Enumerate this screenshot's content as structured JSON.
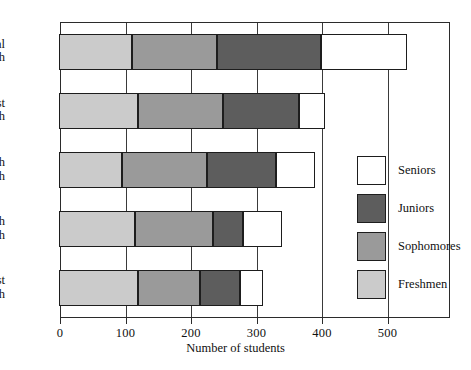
{
  "chart_data": {
    "type": "bar",
    "orientation": "horizontal",
    "stacked": true,
    "title": "",
    "xlabel": "Number of students",
    "ylabel": "",
    "xlim": [
      0,
      560
    ],
    "xticks": [
      0,
      100,
      200,
      300,
      400,
      500
    ],
    "xtick_labels": [
      "0",
      "100",
      "200",
      "300",
      "400",
      "500"
    ],
    "grid": true,
    "legend_position": "right-inside",
    "categories": [
      "Central High",
      "East High",
      "South High",
      "North High",
      "West High"
    ],
    "category_lines": [
      [
        "Central",
        "High"
      ],
      [
        "East",
        "High"
      ],
      [
        "South",
        "High"
      ],
      [
        "North",
        "High"
      ],
      [
        "West",
        "High"
      ]
    ],
    "series": [
      {
        "name": "Freshmen",
        "color": "#cbcbcb",
        "values": [
          110,
          120,
          95,
          115,
          120
        ]
      },
      {
        "name": "Sophomores",
        "color": "#9a9a9a",
        "values": [
          130,
          130,
          130,
          120,
          95
        ]
      },
      {
        "name": "Juniors",
        "color": "#5d5d5d",
        "values": [
          160,
          115,
          105,
          45,
          60
        ]
      },
      {
        "name": "Seniors",
        "color": "#ffffff",
        "values": [
          130,
          40,
          60,
          60,
          35
        ]
      }
    ],
    "totals": [
      530,
      405,
      390,
      340,
      310
    ]
  },
  "legend": {
    "items": [
      {
        "label": "Seniors",
        "color": "#ffffff"
      },
      {
        "label": "Juniors",
        "color": "#5d5d5d"
      },
      {
        "label": "Sophomores",
        "color": "#9a9a9a"
      },
      {
        "label": "Freshmen",
        "color": "#cbcbcb"
      }
    ]
  },
  "colors": {
    "frame": "#2b2b2b",
    "text": "#111111",
    "background": "#ffffff"
  }
}
